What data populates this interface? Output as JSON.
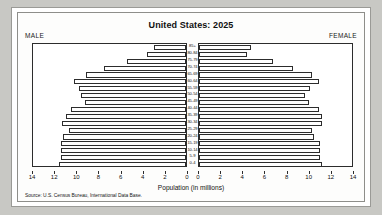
{
  "chart": {
    "title": "United States: 2025",
    "left_header": "MALE",
    "right_header": "FEMALE",
    "axis_caption": "Population (in millions)",
    "source": "Source: U.S. Census Bureau, International Data Base."
  },
  "chart_data": {
    "type": "bar",
    "subtype": "population-pyramid",
    "title": "United States: 2025",
    "xlabel": "Population (in millions)",
    "ylabel": "",
    "grid": false,
    "orientation": "horizontal",
    "bar_fill": "#ffffff",
    "bar_stroke": "#2c2c2c",
    "left_axis": {
      "label": "MALE",
      "ticks": [
        14,
        12,
        10,
        8,
        6,
        4,
        2,
        0
      ],
      "range": [
        14,
        0
      ],
      "direction": "reversed"
    },
    "right_axis": {
      "label": "FEMALE",
      "ticks": [
        0,
        2,
        4,
        6,
        8,
        10,
        12,
        14
      ],
      "range": [
        0,
        14
      ],
      "direction": "normal"
    },
    "categories": [
      "85+",
      "80-84",
      "75-79",
      "70-74",
      "65-69",
      "60-64",
      "55-59",
      "50-54",
      "45-49",
      "40-44",
      "35-39",
      "30-34",
      "25-29",
      "20-24",
      "15-19",
      "10-14",
      "5-9",
      "0-4"
    ],
    "series": [
      {
        "name": "MALE",
        "side": "left",
        "values": [
          2.9,
          3.5,
          5.3,
          7.4,
          9.0,
          10.1,
          9.7,
          9.5,
          9.1,
          10.4,
          10.8,
          11.2,
          10.6,
          11.1,
          11.3,
          11.3,
          11.3,
          11.5
        ]
      },
      {
        "name": "FEMALE",
        "side": "right",
        "values": [
          4.7,
          4.3,
          6.7,
          8.5,
          10.2,
          10.8,
          10.0,
          9.6,
          9.9,
          10.8,
          11.1,
          11.1,
          10.2,
          10.4,
          10.9,
          10.9,
          10.9,
          11.1
        ]
      }
    ]
  }
}
